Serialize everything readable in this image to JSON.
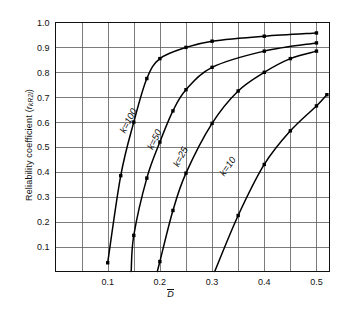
{
  "chart": {
    "type": "line",
    "title": "",
    "y_axis_label": "Reliability coefficient (",
    "y_axis_label_var": "r",
    "y_axis_label_sub": "kR2l",
    "y_axis_label_close": ")",
    "x_axis_label": "D",
    "x_axis_overbar": true
  },
  "chart_data": {
    "type": "line",
    "title": "",
    "xlabel": "D̄",
    "ylabel": "Reliability coefficient ( r_kR2l )",
    "xlim": [
      0.0,
      0.525
    ],
    "ylim": [
      0.0,
      1.0
    ],
    "grid": true,
    "x_major_ticks": [
      0.1,
      0.2,
      0.3,
      0.4,
      0.5
    ],
    "x_tick_labels": [
      "0.1",
      "0.2",
      "0.3",
      "0.4",
      "0.5"
    ],
    "x_gridline_step": 0.05,
    "y_major_ticks": [
      0.1,
      0.2,
      0.3,
      0.4,
      0.5,
      0.6,
      0.7,
      0.8,
      0.9,
      1.0
    ],
    "y_tick_labels": [
      "0.1",
      "0.2",
      "0.3",
      "0.4",
      "0.5",
      "0.6",
      "0.7",
      "0.8",
      "0.9",
      "1.0"
    ],
    "legend": "inline-curve-labels",
    "marker": "square",
    "series": [
      {
        "name": "k = 100",
        "label": "k=100",
        "label_x": 0.145,
        "label_y": 0.6,
        "label_rotation": -62,
        "x": [
          0.1,
          0.125,
          0.15,
          0.175,
          0.2,
          0.25,
          0.3,
          0.4,
          0.5
        ],
        "y": [
          0.035,
          0.385,
          0.6,
          0.775,
          0.855,
          0.9,
          0.925,
          0.945,
          0.958
        ]
      },
      {
        "name": "k = 50",
        "label": "k=50",
        "label_x": 0.195,
        "label_y": 0.525,
        "label_rotation": -64,
        "x": [
          0.145,
          0.15,
          0.175,
          0.2,
          0.225,
          0.25,
          0.3,
          0.4,
          0.5
        ],
        "y": [
          0.0,
          0.145,
          0.375,
          0.52,
          0.645,
          0.73,
          0.82,
          0.885,
          0.918
        ]
      },
      {
        "name": "k = 25",
        "label": "k=25",
        "label_x": 0.245,
        "label_y": 0.455,
        "label_rotation": -63,
        "x": [
          0.195,
          0.2,
          0.225,
          0.25,
          0.3,
          0.35,
          0.4,
          0.45,
          0.5
        ],
        "y": [
          0.0,
          0.04,
          0.245,
          0.395,
          0.595,
          0.725,
          0.8,
          0.855,
          0.885
        ]
      },
      {
        "name": "k = 10",
        "label": "k=10",
        "label_x": 0.335,
        "label_y": 0.415,
        "label_rotation": -55,
        "x": [
          0.305,
          0.35,
          0.4,
          0.45,
          0.5,
          0.52
        ],
        "y": [
          0.0,
          0.225,
          0.43,
          0.565,
          0.665,
          0.71
        ]
      }
    ]
  }
}
